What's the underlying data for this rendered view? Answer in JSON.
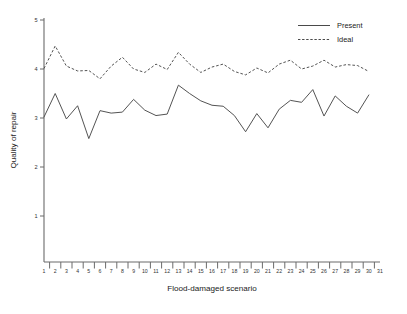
{
  "chart_data": {
    "type": "line",
    "title": "",
    "xlabel": "Flood-damaged scenario",
    "ylabel": "Quality of repair",
    "xlim": [
      1,
      31
    ],
    "ylim": [
      0.5,
      5
    ],
    "yticks": [
      1,
      2,
      3,
      4,
      5
    ],
    "ytick_labels": [
      "1",
      "2",
      "3",
      "4",
      "5"
    ],
    "grid": false,
    "legend_position": "top-right",
    "x": [
      1,
      2,
      3,
      4,
      5,
      6,
      7,
      8,
      9,
      10,
      11,
      12,
      13,
      14,
      15,
      16,
      17,
      18,
      19,
      20,
      21,
      22,
      23,
      24,
      25,
      26,
      27,
      28,
      29,
      30
    ],
    "xtick_labels": [
      "1",
      "2",
      "3",
      "4",
      "5",
      "6",
      "7",
      "8",
      "9",
      "10",
      "11",
      "12",
      "13",
      "14",
      "15",
      "16",
      "17",
      "18",
      "19",
      "20",
      "21",
      "22",
      "23",
      "24",
      "25",
      "26",
      "27",
      "28",
      "29",
      "30",
      "31"
    ],
    "series": [
      {
        "name": "Present",
        "style": "solid",
        "color": "#4a4a4a",
        "values": [
          3.02,
          3.5,
          2.98,
          3.25,
          2.58,
          3.15,
          3.1,
          3.12,
          3.38,
          3.16,
          3.05,
          3.08,
          3.67,
          3.5,
          3.35,
          3.26,
          3.24,
          3.05,
          2.72,
          3.09,
          2.8,
          3.18,
          3.36,
          3.32,
          3.58,
          3.04,
          3.45,
          3.24,
          3.1,
          3.47
        ]
      },
      {
        "name": "Ideal",
        "style": "dashed",
        "color": "#4a4a4a",
        "values": [
          4.01,
          4.47,
          4.06,
          3.96,
          3.97,
          3.8,
          4.06,
          4.24,
          4.0,
          3.93,
          4.1,
          3.99,
          4.34,
          4.1,
          3.93,
          4.04,
          4.1,
          3.95,
          3.88,
          4.02,
          3.92,
          4.1,
          4.18,
          4.0,
          4.06,
          4.18,
          4.04,
          4.09,
          4.07,
          3.95
        ]
      }
    ]
  },
  "legend": {
    "items": [
      {
        "label": "Present",
        "style": "solid"
      },
      {
        "label": "Ideal",
        "style": "dashed"
      }
    ]
  },
  "caption": {
    "text": ""
  }
}
